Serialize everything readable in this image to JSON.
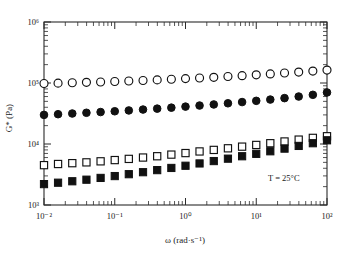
{
  "chart_data": {
    "type": "scatter",
    "title": "",
    "xlabel": "ω (rad·s⁻¹)",
    "ylabel": "G* (Pa)",
    "xscale": "log",
    "yscale": "log",
    "xlim": [
      0.01,
      100
    ],
    "ylim": [
      1000,
      1000000
    ],
    "x_tick_labels": [
      "10⁻²",
      "10⁻¹",
      "10⁰",
      "10¹",
      "10²"
    ],
    "x_tick_values": [
      0.01,
      0.1,
      1,
      10,
      100
    ],
    "y_tick_labels": [
      "10³",
      "10⁴",
      "10⁵",
      "10⁶"
    ],
    "y_tick_values": [
      1000,
      10000,
      100000,
      1000000
    ],
    "grid": false,
    "legend_position": "none",
    "annotations": [
      {
        "text": "T = 25°C",
        "x": 20,
        "y": 2800
      }
    ],
    "x": [
      0.01,
      0.0158,
      0.0251,
      0.0398,
      0.0631,
      0.1,
      0.158,
      0.251,
      0.398,
      0.631,
      1.0,
      1.58,
      2.51,
      3.98,
      6.31,
      10.0,
      15.8,
      25.1,
      39.8,
      63.1,
      100.0
    ],
    "series": [
      {
        "name": "open-circles",
        "marker": "open-circle",
        "values": [
          98000,
          99500,
          101000,
          102500,
          104000,
          106000,
          108000,
          110000,
          112500,
          115000,
          118000,
          121000,
          124000,
          128000,
          132000,
          136000,
          141000,
          146000,
          151000,
          157000,
          163000
        ]
      },
      {
        "name": "filled-circles",
        "marker": "filled-circle",
        "values": [
          30000,
          30800,
          31600,
          32500,
          33400,
          34400,
          35500,
          36700,
          38000,
          39400,
          41000,
          42700,
          44500,
          46500,
          48700,
          51000,
          53500,
          56500,
          60000,
          64000,
          70000
        ]
      },
      {
        "name": "open-squares",
        "marker": "open-square",
        "values": [
          4500,
          4700,
          4850,
          5000,
          5200,
          5450,
          5700,
          6000,
          6300,
          6700,
          7100,
          7550,
          8000,
          8500,
          9050,
          9650,
          10300,
          11000,
          11800,
          12600,
          13400
        ]
      },
      {
        "name": "filled-squares",
        "marker": "filled-square",
        "values": [
          2200,
          2320,
          2450,
          2600,
          2780,
          2980,
          3200,
          3450,
          3730,
          4050,
          4400,
          4800,
          5250,
          5750,
          6300,
          6900,
          7600,
          8400,
          9300,
          10300,
          11500
        ]
      }
    ]
  },
  "axis_labels": {
    "x": "ω (rad·s⁻¹)",
    "y": "G* (Pa)"
  },
  "annotation": {
    "temperature": "T = 25°C"
  },
  "ticks": {
    "x": [
      "10⁻²",
      "10⁻¹",
      "10⁰",
      "10¹",
      "10²"
    ],
    "y": [
      "10³",
      "10⁴",
      "10⁵",
      "10⁶"
    ]
  },
  "colors": {
    "axis": "#2b2b2b",
    "marker_fill": "#111111",
    "marker_open": "#ffffff",
    "background": "#ffffff"
  }
}
